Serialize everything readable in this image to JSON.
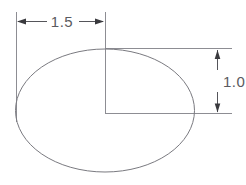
{
  "drawing": {
    "title": "Ellipse dimensioned engineering sketch",
    "background_color": "#ffffff",
    "outline_color": "#7a7a80",
    "dimension_color": "#55555a",
    "extension_color": "#8d8d93",
    "text_color": "#5a5a60",
    "shape": {
      "name": "ellipse",
      "center_x": 105,
      "center_y": 110,
      "radius_x": 90,
      "radius_y": 62
    },
    "dimensions": [
      {
        "id": "horizontal-semi-major",
        "label": "1.5",
        "orientation": "horizontal",
        "from_x": 16,
        "to_x": 105,
        "line_y": 21,
        "text_x": 62,
        "text_y": 26
      },
      {
        "id": "vertical-semi-minor",
        "label": "1.0",
        "orientation": "vertical",
        "from_y": 49,
        "to_y": 113,
        "line_x": 217,
        "text_x": 224,
        "text_y": 87
      }
    ],
    "extension_lines": [
      {
        "id": "left-vertical-extension",
        "x1": 16,
        "y1": 12,
        "x2": 16,
        "y2": 122
      },
      {
        "id": "center-vertical-extension",
        "x1": 105,
        "y1": 12,
        "x2": 105,
        "y2": 113
      },
      {
        "id": "top-horizontal-extension",
        "x1": 105,
        "y1": 49,
        "x2": 232,
        "y2": 49
      },
      {
        "id": "bottom-horizontal-extension",
        "x1": 105,
        "y1": 113,
        "x2": 232,
        "y2": 113
      }
    ]
  }
}
